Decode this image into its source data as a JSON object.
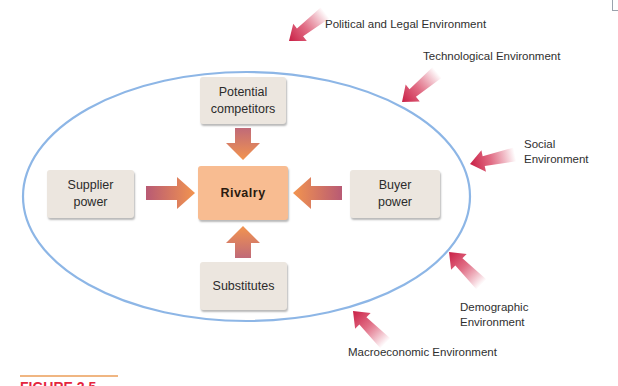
{
  "figure": {
    "caption_label": "FIGURE 2.5"
  },
  "colors": {
    "ellipse": "#8db6e6",
    "box_fill": "#ece6df",
    "rivalry_fill": "#f8bc91",
    "inner_arrow_start": "#b85a74",
    "inner_arrow_end": "#f0944f",
    "outer_arrow": "#cf2347",
    "caption_red": "#e4263e",
    "caption_rule": "#f0b682"
  },
  "forces": {
    "center": "Rivalry",
    "top": [
      "Potential",
      "competitors"
    ],
    "left": [
      "Supplier",
      "power"
    ],
    "right": [
      "Buyer",
      "power"
    ],
    "bottom": "Substitutes"
  },
  "environments": {
    "political": "Political and Legal Environment",
    "technological": "Technological Environment",
    "social": [
      "Social",
      "Environment"
    ],
    "demographic": [
      "Demographic",
      "Environment"
    ],
    "macroeconomic": "Macroeconomic Environment"
  }
}
